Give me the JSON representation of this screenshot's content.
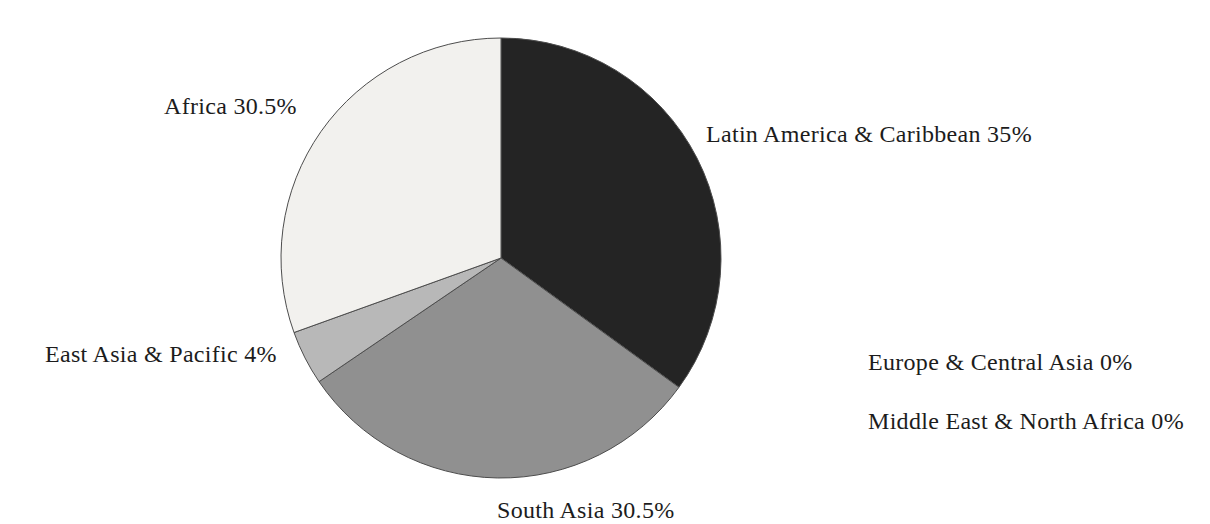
{
  "page": {
    "background_color": "#ffffff",
    "text_color": "#1c1c1c"
  },
  "chart_data": {
    "type": "pie",
    "title": "",
    "unit": "%",
    "direction": "clockwise",
    "start_angle_deg": 0,
    "legend_position": "none",
    "labels_placement": "outside",
    "outline_color": "#4d4d4d",
    "center": {
      "cx": 501,
      "cy": 258,
      "r": 220
    },
    "slices": [
      {
        "id": "latin-america-caribbean",
        "label": "Latin America & Caribbean",
        "value": 35,
        "display_label": "Latin America & Caribbean 35%",
        "color": "#242424"
      },
      {
        "id": "europe-central-asia",
        "label": "Europe & Central Asia",
        "value": 0,
        "display_label": "Europe & Central Asia 0%",
        "color": "#ffffff"
      },
      {
        "id": "middle-east-north-africa",
        "label": "Middle East & North Africa",
        "value": 0,
        "display_label": "Middle East & North Africa 0%",
        "color": "#ffffff"
      },
      {
        "id": "south-asia",
        "label": "South Asia",
        "value": 30.5,
        "display_label": "South Asia 30.5%",
        "color": "#909090"
      },
      {
        "id": "east-asia-pacific",
        "label": "East Asia & Pacific",
        "value": 4,
        "display_label": "East Asia & Pacific 4%",
        "color": "#b8b8b8"
      },
      {
        "id": "africa",
        "label": "Africa",
        "value": 30.5,
        "display_label": "Africa 30.5%",
        "color": "#f2f1ee"
      }
    ]
  }
}
